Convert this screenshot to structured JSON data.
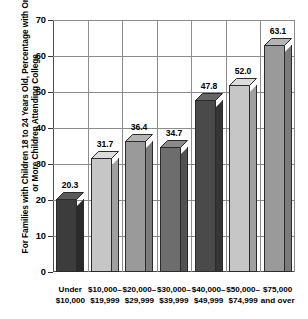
{
  "chart_data": {
    "type": "bar",
    "title": "",
    "subtitle": "",
    "xlabel": "",
    "ylabel": "For Families with Children 18 to 24 Years Old, Percentage with One or More Children Attending College",
    "ylim": [
      0,
      70
    ],
    "yticks": [
      0,
      10,
      20,
      30,
      40,
      50,
      60,
      70
    ],
    "ytick_labels": [
      "0",
      "10",
      "20",
      "30",
      "40",
      "50",
      "60",
      "70"
    ],
    "grid": "horizontal-and-vertical",
    "legend": "none",
    "three_d": true,
    "categories": [
      "Under\n$10,000",
      "$10,000–\n$19,999",
      "$20,000–\n$29,999",
      "$30,000–\n$39,999",
      "$40,000–\n$49,999",
      "$50,000–\n$74,999",
      "$75,000\nand over"
    ],
    "category_lines": [
      [
        "Under",
        "$10,000"
      ],
      [
        "$10,000–",
        "$19,999"
      ],
      [
        "$20,000–",
        "$29,999"
      ],
      [
        "$30,000–",
        "$39,999"
      ],
      [
        "$40,000–",
        "$49,999"
      ],
      [
        "$50,000–",
        "$74,999"
      ],
      [
        "$75,000",
        "and over"
      ]
    ],
    "values": [
      20.3,
      31.7,
      36.4,
      34.7,
      47.8,
      52.0,
      63.1
    ],
    "data_labels": [
      "20.3",
      "31.7",
      "36.4",
      "34.7",
      "47.8",
      "52.0",
      "63.1"
    ],
    "bar_colors": [
      "#3c3c3c",
      "#c6c6c6",
      "#9a9a9a",
      "#6d6d6d",
      "#4a4a4a",
      "#c6c6c6",
      "#9a9a9a"
    ],
    "bar_side_colors": [
      "#2a2a2a",
      "#a0a0a0",
      "#7b7b7b",
      "#525252",
      "#353535",
      "#a0a0a0",
      "#7b7b7b"
    ],
    "bar_top_colors": [
      "#5a5a5a",
      "#dcdcdc",
      "#b4b4b4",
      "#8a8a8a",
      "#666666",
      "#dcdcdc",
      "#b4b4b4"
    ],
    "outline_color": "#2b2b2b",
    "grid_color": "#8c8c8c",
    "axis_color": "#4d4d4d"
  }
}
